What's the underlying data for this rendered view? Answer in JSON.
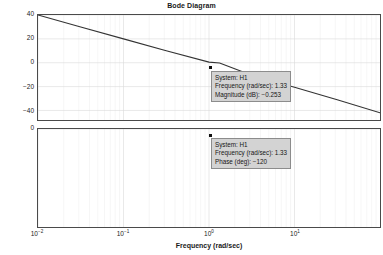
{
  "chart_data": {
    "type": "line",
    "title": "Bode Diagram",
    "xlabel": "Frequency (rad/sec)",
    "xscale": "log",
    "xlim": [
      0.01,
      100
    ],
    "xticks": [
      {
        "value": 0.01,
        "label_base": "10",
        "label_exp": "-2"
      },
      {
        "value": 0.1,
        "label_base": "10",
        "label_exp": "-1"
      },
      {
        "value": 1,
        "label_base": "10",
        "label_exp": "0"
      },
      {
        "value": 10,
        "label_base": "10",
        "label_exp": "1"
      }
    ],
    "grid": true,
    "subplots": [
      {
        "name": "magnitude",
        "ylabel": "",
        "ylim": [
          -48,
          40
        ],
        "yticks": [
          40,
          20,
          0,
          -20,
          -40
        ],
        "ytick_labels": [
          "40",
          "20",
          "0",
          "−20",
          "−40"
        ],
        "series": [
          {
            "name": "H1",
            "x": [
              0.01,
              0.0316,
              0.1,
              0.316,
              1,
              1.33,
              3.16,
              10,
              31.6,
              100
            ],
            "y": [
              40,
              30,
              20,
              10,
              0.5,
              -0.253,
              -10.5,
              -20.5,
              -31,
              -42
            ]
          }
        ],
        "datatip": {
          "system": "System: H1",
          "frequency": "Frequency (rad/sec): 1.33",
          "value": "Magnitude (dB): −0.253"
        },
        "marker_point": {
          "x": 1.33,
          "y": -0.253
        }
      },
      {
        "name": "phase",
        "ylabel": "",
        "ylim": [
          3240,
          0
        ],
        "yticks": [
          0,
          -360,
          -720,
          1080,
          1440,
          1800,
          2160,
          2520,
          2880,
          3240
        ],
        "ytick_labels": [
          "0",
          "−360",
          "−720",
          "1080",
          "1440",
          "1800",
          "2160",
          "2520",
          "2880",
          "3240"
        ],
        "series": [
          {
            "name": "H1",
            "x": [
              0.01,
              0.1,
              0.5,
              1,
              1.33,
              2,
              3.16,
              5,
              10,
              20,
              40,
              70,
              100
            ],
            "y": [
              -60,
              -65,
              -85,
              -105,
              -120,
              -170,
              -260,
              -420,
              -900,
              -1650,
              -2350,
              -2800,
              -3060
            ]
          }
        ],
        "datatip": {
          "system": "System: H1",
          "frequency": "Frequency (rad/sec): 1.33",
          "value": "Phase (deg): −120"
        },
        "marker_point": {
          "x": 1.33,
          "y": -120
        }
      }
    ]
  },
  "figure": {
    "title": "Bode Diagram",
    "xlabel": "Frequency (rad/sec)"
  },
  "colors": {
    "background": "#ffffff",
    "axis": "#4a4a4a",
    "curve": "#333333",
    "grid": "#d9d9d9",
    "datatip_bg": "#d3d3d3",
    "text": "#1a1a1a"
  }
}
